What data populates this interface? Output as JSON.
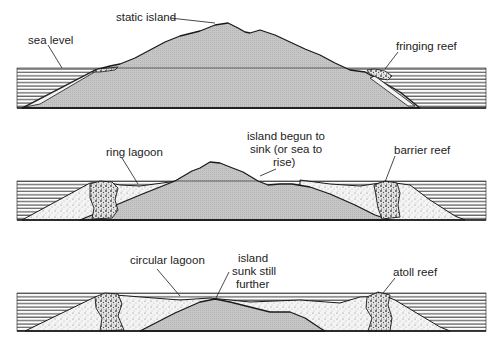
{
  "diagram": {
    "type": "coral reef formation stages",
    "colors": {
      "island": "#c9c9c9",
      "sediment": "#f2f2f2",
      "reef": "#d8d8d8",
      "outline": "#1a1a1a",
      "water_lines": "#333333",
      "background": "#ffffff"
    },
    "stages": [
      {
        "name": "fringing reef stage",
        "labels": {
          "island": "static island",
          "sea": "sea level",
          "reef": "fringing reef"
        }
      },
      {
        "name": "barrier reef stage",
        "labels": {
          "lagoon": "ring lagoon",
          "island_line1": "island begun to",
          "island_line2": "sink (or sea to",
          "island_line3": "rise)",
          "reef": "barrier reef"
        }
      },
      {
        "name": "atoll stage",
        "labels": {
          "lagoon": "circular lagoon",
          "island_line1": "island",
          "island_line2": "sunk still",
          "island_line3": "further",
          "reef": "atoll reef"
        }
      }
    ]
  }
}
